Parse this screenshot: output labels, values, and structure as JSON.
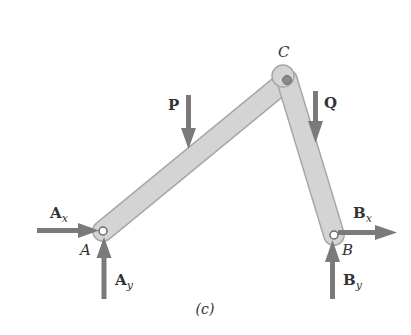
{
  "figure": {
    "caption": "(c)",
    "colors": {
      "background": "#ffffff",
      "member_fill": "#d3d3d3",
      "member_stroke": "#a8a8a8",
      "arrow": "#7a7a7a",
      "pin_fill": "#8a8a8a",
      "text": "#333333"
    },
    "points": {
      "A": {
        "label": "A",
        "x": 103,
        "y": 231
      },
      "B": {
        "label": "B",
        "x": 334,
        "y": 235
      },
      "C": {
        "label": "C",
        "x": 287,
        "y": 80
      }
    },
    "members": [
      {
        "name": "member-AC",
        "from": "A",
        "to": "C"
      },
      {
        "name": "member-CB",
        "from": "C",
        "to": "B"
      }
    ],
    "forces": {
      "P": {
        "label": "P",
        "direction": "down"
      },
      "Q": {
        "label": "Q",
        "direction": "down"
      },
      "Ax": {
        "main": "A",
        "sub": "x",
        "direction": "right"
      },
      "Ay": {
        "main": "A",
        "sub": "y",
        "direction": "up"
      },
      "Bx": {
        "main": "B",
        "sub": "x",
        "direction": "right"
      },
      "By": {
        "main": "B",
        "sub": "y",
        "direction": "up"
      }
    }
  }
}
